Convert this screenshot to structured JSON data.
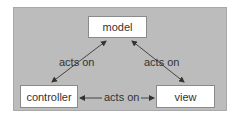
{
  "diagram": {
    "nodes": {
      "model": "model",
      "controller": "controller",
      "view": "view"
    },
    "edges": [
      {
        "from": "controller",
        "to": "model",
        "label": "acts on"
      },
      {
        "from": "view",
        "to": "model",
        "label": "acts on"
      },
      {
        "from": "controller",
        "to": "view",
        "label": "acts on"
      }
    ],
    "colors": {
      "background": "#bcbcbc",
      "box": "#ffffff",
      "arrow": "#333333"
    }
  }
}
